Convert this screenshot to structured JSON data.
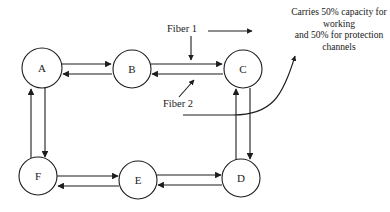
{
  "diagram": {
    "type": "ring-network-topology",
    "nodes": [
      {
        "id": "A",
        "label": "A",
        "cx": 42,
        "cy": 68,
        "r": 20
      },
      {
        "id": "B",
        "label": "B",
        "cx": 132,
        "cy": 69,
        "r": 19
      },
      {
        "id": "C",
        "label": "C",
        "cx": 243,
        "cy": 69,
        "r": 19
      },
      {
        "id": "D",
        "label": "D",
        "cx": 241,
        "cy": 178,
        "r": 19
      },
      {
        "id": "E",
        "label": "E",
        "cx": 138,
        "cy": 180,
        "r": 19
      },
      {
        "id": "F",
        "label": "F",
        "cx": 38,
        "cy": 176,
        "r": 19
      }
    ],
    "links": [
      {
        "from": "A",
        "to": "B",
        "direction": "bidirectional",
        "fibers": 2
      },
      {
        "from": "B",
        "to": "C",
        "direction": "bidirectional",
        "fibers": 2
      },
      {
        "from": "C",
        "to": "D",
        "direction": "bidirectional",
        "fibers": 2
      },
      {
        "from": "D",
        "to": "E",
        "direction": "bidirectional",
        "fibers": 2
      },
      {
        "from": "E",
        "to": "F",
        "direction": "bidirectional",
        "fibers": 2
      },
      {
        "from": "F",
        "to": "A",
        "direction": "bidirectional",
        "fibers": 2
      }
    ],
    "labels": {
      "fiber_1": "Fiber 1",
      "fiber_2": "Fiber 2"
    },
    "annotation": {
      "line_1": "Carries 50% capacity for",
      "line_2": "working",
      "line_3": "and 50% for protection",
      "line_4": "channels",
      "full_text": "Carries 50% capacity for working and 50% for protection channels"
    },
    "colors": {
      "stroke": "#1d1d1d",
      "node_fill": "#ffffff",
      "text": "#1a1a1a",
      "background": "#ffffff"
    }
  }
}
